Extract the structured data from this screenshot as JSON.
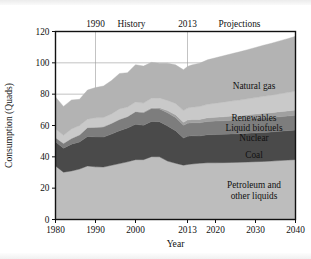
{
  "figure": {
    "header_labels": [
      {
        "text": "1990",
        "x": 1990
      },
      {
        "text": "History",
        "x": 1999
      },
      {
        "text": "2013",
        "x": 2013
      },
      {
        "text": "Projections",
        "x": 2026
      }
    ],
    "divider_years": [
      1990,
      2013
    ]
  },
  "chart_data": {
    "type": "area",
    "stacked": true,
    "title": "",
    "xlabel": "Year",
    "ylabel": "Consumption (Quads)",
    "xlim": [
      1980,
      2040
    ],
    "ylim": [
      0,
      120
    ],
    "xticks": [
      1980,
      1990,
      2000,
      2013,
      2020,
      2030,
      2040
    ],
    "yticks": [
      0,
      20,
      40,
      60,
      80,
      100,
      120
    ],
    "grid": true,
    "legend": "inline-annotations",
    "x": [
      1980,
      1982,
      1984,
      1986,
      1988,
      1990,
      1992,
      1994,
      1996,
      1998,
      2000,
      2002,
      2004,
      2006,
      2008,
      2010,
      2012,
      2013,
      2014,
      2016,
      2018,
      2020,
      2022,
      2024,
      2026,
      2028,
      2030,
      2032,
      2034,
      2036,
      2038,
      2040
    ],
    "series": [
      {
        "name": "Petroleum and other liquids",
        "color": "#bdbdbd",
        "label": "Petroleum and\nother liquids",
        "values": [
          34.2,
          30.2,
          31.0,
          32.2,
          34.2,
          33.6,
          33.5,
          34.6,
          35.7,
          36.8,
          38.2,
          38.2,
          40.1,
          40.0,
          37.3,
          35.9,
          34.7,
          35.1,
          35.4,
          35.9,
          36.2,
          36.2,
          36.3,
          36.4,
          36.5,
          36.7,
          36.9,
          37.1,
          37.3,
          37.6,
          37.9,
          38.2
        ]
      },
      {
        "name": "Coal",
        "color": "#4a4a4a",
        "label": "Coal",
        "values": [
          15.4,
          15.3,
          17.1,
          17.3,
          18.8,
          19.1,
          19.1,
          19.9,
          21.0,
          21.6,
          22.6,
          21.9,
          22.5,
          22.4,
          22.4,
          20.8,
          17.3,
          18.0,
          18.0,
          17.4,
          17.9,
          18.0,
          18.1,
          18.2,
          18.2,
          18.3,
          18.4,
          18.5,
          18.6,
          18.7,
          18.8,
          18.9
        ]
      },
      {
        "name": "Nuclear",
        "color": "#7d7d7d",
        "label": "Nuclear",
        "values": [
          2.7,
          3.1,
          3.6,
          4.5,
          5.6,
          6.1,
          6.5,
          6.8,
          7.1,
          7.2,
          7.9,
          8.1,
          8.2,
          8.2,
          8.4,
          8.4,
          8.1,
          8.3,
          8.3,
          8.4,
          8.5,
          8.6,
          8.7,
          8.8,
          8.9,
          9.0,
          9.1,
          9.2,
          9.2,
          9.3,
          9.3,
          9.4
        ]
      },
      {
        "name": "Liquid biofuels",
        "color": "#a0a0a0",
        "label": "Liquid biofuels",
        "values": [
          0.0,
          0.0,
          0.1,
          0.1,
          0.1,
          0.1,
          0.2,
          0.2,
          0.2,
          0.2,
          0.3,
          0.4,
          0.5,
          0.8,
          1.4,
          1.8,
          2.0,
          2.1,
          2.1,
          2.2,
          2.3,
          2.4,
          2.5,
          2.6,
          2.7,
          2.8,
          2.9,
          3.0,
          3.1,
          3.2,
          3.3,
          3.4
        ]
      },
      {
        "name": "Renewables",
        "color": "#c9c9c9",
        "label": "Renewables",
        "values": [
          5.5,
          5.2,
          6.0,
          5.9,
          5.3,
          6.0,
          5.8,
          5.9,
          6.6,
          6.0,
          6.0,
          5.7,
          6.1,
          6.2,
          6.5,
          7.2,
          7.4,
          7.6,
          7.8,
          8.2,
          8.6,
          9.0,
          9.3,
          9.6,
          9.9,
          10.2,
          10.5,
          10.8,
          11.1,
          11.4,
          11.7,
          12.0
        ]
      },
      {
        "name": "Natural gas",
        "color": "#b3b3b3",
        "label": "Natural gas",
        "values": [
          20.4,
          18.4,
          18.5,
          16.7,
          18.6,
          19.3,
          20.1,
          21.3,
          22.6,
          21.9,
          23.8,
          23.6,
          22.9,
          22.2,
          23.8,
          24.6,
          26.1,
          26.6,
          27.0,
          27.6,
          28.4,
          29.0,
          29.6,
          30.2,
          30.8,
          31.4,
          32.0,
          32.6,
          33.2,
          33.8,
          34.4,
          35.0
        ]
      }
    ]
  },
  "annotations": {
    "natural_gas": "Natural gas",
    "renewables": "Renewables",
    "liquid_biofuels": "Liquid biofuels",
    "nuclear": "Nuclear",
    "coal": "Coal",
    "petroleum_line1": "Petroleum and",
    "petroleum_line2": "other liquids"
  }
}
